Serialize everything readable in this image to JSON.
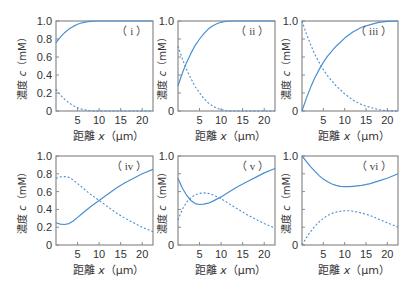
{
  "colors": {
    "line": "#4a8fd0",
    "axis": "#8a8a8a",
    "text": "#333333"
  },
  "axis_labels": {
    "ylabel_prefix": "濃度 ",
    "ylabel_var": "c",
    "ylabel_unit": "（mM）",
    "xlabel_prefix": "距離 ",
    "xlabel_var": "x",
    "xlabel_unit": "（μm）"
  },
  "chart_data": [
    {
      "type": "line",
      "panel_label": "（ i ）",
      "xlabel": "距離 x（μm）",
      "ylabel": "濃度 c（mM）",
      "xlim": [
        0,
        22.5
      ],
      "ylim": [
        0,
        1.0
      ],
      "xticks": [
        5,
        10,
        15,
        20
      ],
      "yticks": [
        0,
        0.2,
        0.4,
        0.6,
        0.8,
        1.0
      ],
      "ytick_labels": [
        "0",
        "0.2",
        "0.4",
        "0.6",
        "0.8",
        "1.0"
      ],
      "series": [
        {
          "name": "solid",
          "style": "solid",
          "x": [
            0,
            1,
            2,
            3,
            4,
            5,
            6,
            7,
            8,
            9,
            10,
            12,
            15,
            20,
            22.5
          ],
          "y": [
            0.76,
            0.82,
            0.87,
            0.91,
            0.94,
            0.965,
            0.98,
            0.99,
            0.997,
            1.0,
            1.0,
            1.0,
            1.0,
            1.0,
            1.0
          ]
        },
        {
          "name": "dashed",
          "style": "dashed",
          "x": [
            0,
            1,
            2,
            3,
            4,
            5,
            6,
            7,
            8,
            9,
            10,
            12,
            15,
            20,
            22.5
          ],
          "y": [
            0.24,
            0.18,
            0.13,
            0.09,
            0.06,
            0.035,
            0.02,
            0.01,
            0.003,
            0.0,
            0.0,
            0.0,
            0.0,
            0.0,
            0.0
          ]
        }
      ]
    },
    {
      "type": "line",
      "panel_label": "（ ii ）",
      "xlabel": "距離 x（μm）",
      "ylabel": "濃度 c（mM）",
      "xlim": [
        0,
        22.5
      ],
      "ylim": [
        0,
        1.0
      ],
      "xticks": [
        5,
        10,
        15,
        20
      ],
      "yticks": [
        0,
        0.2,
        0.4,
        0.6,
        0.8,
        1.0
      ],
      "ytick_labels": [
        "0",
        "",
        "",
        "",
        "",
        "1.0"
      ],
      "series": [
        {
          "name": "solid",
          "style": "solid",
          "x": [
            0,
            1,
            2,
            3,
            4,
            5,
            6,
            7,
            8,
            9,
            10,
            11,
            12,
            15,
            20,
            22.5
          ],
          "y": [
            0.28,
            0.42,
            0.54,
            0.64,
            0.73,
            0.8,
            0.86,
            0.91,
            0.945,
            0.97,
            0.985,
            0.995,
            1.0,
            1.0,
            1.0,
            1.0
          ]
        },
        {
          "name": "dashed",
          "style": "dashed",
          "x": [
            0,
            1,
            2,
            3,
            4,
            5,
            6,
            7,
            8,
            9,
            10,
            11,
            12,
            15,
            20,
            22.5
          ],
          "y": [
            0.72,
            0.58,
            0.46,
            0.36,
            0.27,
            0.2,
            0.14,
            0.09,
            0.055,
            0.03,
            0.015,
            0.005,
            0.0,
            0.0,
            0.0,
            0.0
          ]
        }
      ]
    },
    {
      "type": "line",
      "panel_label": "（ iii ）",
      "xlabel": "距離 x（μm）",
      "ylabel": "濃度 c（mM）",
      "xlim": [
        0,
        22.5
      ],
      "ylim": [
        0,
        1.0
      ],
      "xticks": [
        5,
        10,
        15,
        20
      ],
      "yticks": [
        0,
        0.2,
        0.4,
        0.6,
        0.8,
        1.0
      ],
      "ytick_labels": [
        "0",
        "",
        "",
        "",
        "",
        "1.0"
      ],
      "series": [
        {
          "name": "solid",
          "style": "solid",
          "x": [
            0,
            1,
            2,
            3,
            4,
            5,
            6,
            8,
            10,
            12,
            14,
            16,
            18,
            20,
            22.5
          ],
          "y": [
            0.0,
            0.14,
            0.26,
            0.37,
            0.46,
            0.54,
            0.61,
            0.72,
            0.81,
            0.88,
            0.93,
            0.96,
            0.985,
            0.997,
            1.0
          ]
        },
        {
          "name": "dashed",
          "style": "dashed",
          "x": [
            0,
            1,
            2,
            3,
            4,
            5,
            6,
            8,
            10,
            12,
            14,
            16,
            18,
            20,
            22.5
          ],
          "y": [
            1.0,
            0.86,
            0.74,
            0.63,
            0.54,
            0.46,
            0.39,
            0.28,
            0.19,
            0.12,
            0.07,
            0.04,
            0.015,
            0.003,
            0.0
          ]
        }
      ]
    },
    {
      "type": "line",
      "panel_label": "（ iv ）",
      "xlabel": "距離 x（μm）",
      "ylabel": "濃度 c（mM）",
      "xlim": [
        0,
        22.5
      ],
      "ylim": [
        0,
        1.0
      ],
      "xticks": [
        5,
        10,
        15,
        20
      ],
      "yticks": [
        0,
        0.2,
        0.4,
        0.6,
        0.8,
        1.0
      ],
      "ytick_labels": [
        "0",
        "0.2",
        "0.4",
        "0.6",
        "0.8",
        "1.0"
      ],
      "series": [
        {
          "name": "solid",
          "style": "solid",
          "x": [
            0,
            1,
            2,
            3,
            4,
            5,
            6,
            8,
            10,
            12,
            14,
            16,
            18,
            20,
            22.5
          ],
          "y": [
            0.25,
            0.235,
            0.23,
            0.24,
            0.27,
            0.31,
            0.35,
            0.43,
            0.5,
            0.57,
            0.64,
            0.7,
            0.75,
            0.8,
            0.85
          ]
        },
        {
          "name": "dashed",
          "style": "dashed",
          "x": [
            0,
            1,
            2,
            3,
            4,
            5,
            6,
            8,
            10,
            12,
            14,
            16,
            18,
            20,
            22.5
          ],
          "y": [
            0.75,
            0.765,
            0.77,
            0.76,
            0.73,
            0.69,
            0.65,
            0.57,
            0.5,
            0.43,
            0.36,
            0.3,
            0.25,
            0.2,
            0.15
          ]
        }
      ]
    },
    {
      "type": "line",
      "panel_label": "（ v ）",
      "xlabel": "距離 x（μm）",
      "ylabel": "濃度 c（mM）",
      "xlim": [
        0,
        22.5
      ],
      "ylim": [
        0,
        1.0
      ],
      "xticks": [
        5,
        10,
        15,
        20
      ],
      "yticks": [
        0,
        0.2,
        0.4,
        0.6,
        0.8,
        1.0
      ],
      "ytick_labels": [
        "0",
        "",
        "",
        "",
        "",
        "1.0"
      ],
      "series": [
        {
          "name": "solid",
          "style": "solid",
          "x": [
            0,
            1,
            2,
            3,
            4,
            5,
            6,
            7,
            8,
            10,
            12,
            14,
            16,
            18,
            20,
            22.5
          ],
          "y": [
            0.75,
            0.64,
            0.56,
            0.5,
            0.465,
            0.455,
            0.46,
            0.47,
            0.49,
            0.54,
            0.6,
            0.66,
            0.71,
            0.76,
            0.81,
            0.86
          ]
        },
        {
          "name": "dashed",
          "style": "dashed",
          "x": [
            0,
            1,
            2,
            3,
            4,
            5,
            6,
            7,
            8,
            10,
            12,
            14,
            16,
            18,
            20,
            22.5
          ],
          "y": [
            0.28,
            0.4,
            0.48,
            0.53,
            0.565,
            0.58,
            0.585,
            0.58,
            0.565,
            0.52,
            0.46,
            0.4,
            0.34,
            0.29,
            0.24,
            0.19
          ]
        }
      ]
    },
    {
      "type": "line",
      "panel_label": "（ vi ）",
      "xlabel": "距離 x（μm）",
      "ylabel": "濃度 c（mM）",
      "xlim": [
        0,
        22.5
      ],
      "ylim": [
        0,
        1.0
      ],
      "xticks": [
        5,
        10,
        15,
        20
      ],
      "yticks": [
        0,
        0.2,
        0.4,
        0.6,
        0.8,
        1.0
      ],
      "ytick_labels": [
        "0",
        "",
        "",
        "",
        "",
        "1.0"
      ],
      "series": [
        {
          "name": "solid",
          "style": "solid",
          "x": [
            0,
            1,
            2,
            3,
            4,
            5,
            6,
            7,
            8,
            9,
            10,
            11,
            12,
            14,
            16,
            18,
            20,
            22.5
          ],
          "y": [
            1.0,
            0.94,
            0.88,
            0.83,
            0.78,
            0.74,
            0.71,
            0.685,
            0.67,
            0.66,
            0.655,
            0.655,
            0.66,
            0.67,
            0.69,
            0.72,
            0.75,
            0.8
          ]
        },
        {
          "name": "dashed",
          "style": "dashed",
          "x": [
            0,
            1,
            2,
            3,
            4,
            5,
            6,
            7,
            8,
            9,
            10,
            11,
            12,
            14,
            16,
            18,
            20,
            22.5
          ],
          "y": [
            0.0,
            0.08,
            0.15,
            0.21,
            0.26,
            0.3,
            0.33,
            0.355,
            0.37,
            0.38,
            0.385,
            0.385,
            0.38,
            0.36,
            0.33,
            0.29,
            0.25,
            0.2
          ]
        }
      ]
    }
  ]
}
